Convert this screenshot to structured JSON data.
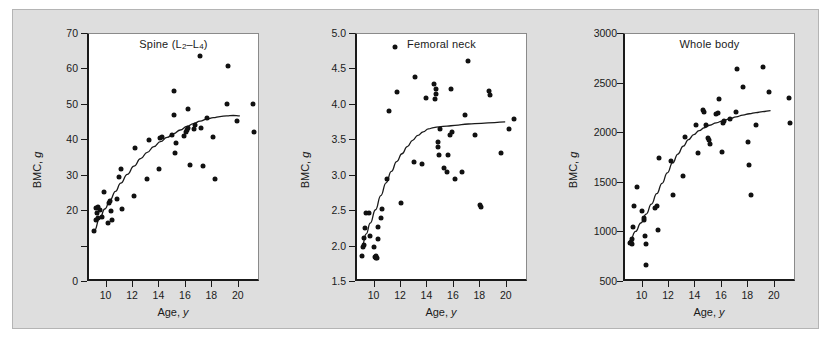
{
  "figure": {
    "background_color": "#dedede",
    "plot_background_color": "#ffffff",
    "point_color": "#111111",
    "axis_color": "#1a1a1a"
  },
  "chart_data": [
    {
      "type": "scatter",
      "title": "Spine (L2–L4)",
      "title_main": "Spine (L",
      "title_sub1": "2",
      "title_mid": "–L",
      "title_sub2": "4",
      "title_end": ")",
      "xlabel": "Age, y",
      "xlabel_text": "Age, ",
      "xlabel_italic": "y",
      "ylabel": "BMC, g",
      "ylabel_text": "BMC, ",
      "ylabel_italic": "g",
      "xlim": [
        8.6,
        21.6
      ],
      "ylim": [
        0,
        70
      ],
      "xticks": [
        10,
        12,
        14,
        16,
        18,
        20
      ],
      "xticklabels": [
        "10",
        "12",
        "14",
        "16",
        "18",
        "20"
      ],
      "yticks": [
        0,
        10,
        20,
        30,
        40,
        50,
        60,
        70
      ],
      "yticklabels": [
        "0",
        "",
        "20",
        "30",
        "40",
        "50",
        "60",
        "70"
      ],
      "grid": false,
      "legend": "none",
      "points": [
        [
          9.0,
          14.3
        ],
        [
          9.1,
          17.6
        ],
        [
          9.15,
          20.9
        ],
        [
          9.2,
          19.6
        ],
        [
          9.25,
          18.1
        ],
        [
          9.3,
          21.2
        ],
        [
          9.45,
          20.3
        ],
        [
          9.55,
          18.3
        ],
        [
          9.7,
          25.4
        ],
        [
          10.0,
          16.7
        ],
        [
          10.1,
          22.4
        ],
        [
          10.2,
          23.0
        ],
        [
          10.25,
          20.0
        ],
        [
          10.35,
          17.5
        ],
        [
          10.7,
          23.4
        ],
        [
          10.9,
          29.5
        ],
        [
          11.0,
          31.8
        ],
        [
          11.1,
          20.7
        ],
        [
          12.0,
          24.2
        ],
        [
          12.1,
          37.8
        ],
        [
          13.0,
          29.0
        ],
        [
          13.1,
          40.2
        ],
        [
          13.9,
          31.8
        ],
        [
          14.0,
          40.6
        ],
        [
          14.1,
          40.9
        ],
        [
          14.9,
          41.4
        ],
        [
          15.0,
          47.0
        ],
        [
          15.05,
          53.9
        ],
        [
          15.1,
          36.5
        ],
        [
          15.2,
          39.1
        ],
        [
          15.8,
          41.2
        ],
        [
          15.9,
          42.4
        ],
        [
          16.0,
          42.9
        ],
        [
          16.05,
          48.9
        ],
        [
          16.1,
          43.4
        ],
        [
          16.2,
          32.9
        ],
        [
          16.5,
          43.1
        ],
        [
          16.6,
          44.2
        ],
        [
          17.0,
          63.9
        ],
        [
          17.1,
          43.5
        ],
        [
          17.2,
          32.8
        ],
        [
          17.5,
          46.4
        ],
        [
          18.0,
          41.0
        ],
        [
          18.1,
          29.0
        ],
        [
          19.0,
          50.2
        ],
        [
          19.1,
          60.9
        ],
        [
          19.8,
          45.5
        ],
        [
          21.0,
          50.3
        ],
        [
          21.1,
          42.2
        ]
      ],
      "fit_curve": [
        [
          9.0,
          14.5
        ],
        [
          9.4,
          17.8
        ],
        [
          9.8,
          20.6
        ],
        [
          10.2,
          23.2
        ],
        [
          10.6,
          25.6
        ],
        [
          11.0,
          27.9
        ],
        [
          11.5,
          30.4
        ],
        [
          12.0,
          32.7
        ],
        [
          12.5,
          34.8
        ],
        [
          13.0,
          36.6
        ],
        [
          13.5,
          38.2
        ],
        [
          14.0,
          39.6
        ],
        [
          14.5,
          40.8
        ],
        [
          15.0,
          41.9
        ],
        [
          15.5,
          42.9
        ],
        [
          16.0,
          43.9
        ],
        [
          16.5,
          44.7
        ],
        [
          17.0,
          45.4
        ],
        [
          17.5,
          46.0
        ],
        [
          18.0,
          46.4
        ],
        [
          18.5,
          46.7
        ],
        [
          19.0,
          46.9
        ],
        [
          19.5,
          47.0
        ],
        [
          20.0,
          46.9
        ]
      ]
    },
    {
      "type": "scatter",
      "title": "Femoral neck",
      "xlabel": "Age, y",
      "xlabel_text": "Age, ",
      "xlabel_italic": "y",
      "ylabel": "BMC, g",
      "ylabel_text": "BMC, ",
      "ylabel_italic": "g",
      "xlim": [
        8.6,
        21.6
      ],
      "ylim": [
        1.5,
        5.0
      ],
      "xticks": [
        10,
        12,
        14,
        16,
        18,
        20
      ],
      "xticklabels": [
        "10",
        "12",
        "14",
        "16",
        "18",
        "20"
      ],
      "yticks": [
        1.5,
        2.0,
        2.5,
        3.0,
        3.5,
        4.0,
        4.5,
        5.0
      ],
      "yticklabels": [
        "1.5",
        "2.0",
        "2.5",
        "3.0",
        "3.5",
        "4.0",
        "4.5",
        "5.0"
      ],
      "grid": false,
      "legend": "none",
      "points": [
        [
          9.0,
          1.86
        ],
        [
          9.05,
          2.0
        ],
        [
          9.1,
          2.02
        ],
        [
          9.15,
          2.12
        ],
        [
          9.2,
          2.26
        ],
        [
          9.25,
          2.48
        ],
        [
          9.5,
          2.48
        ],
        [
          9.6,
          2.15
        ],
        [
          9.9,
          2.0
        ],
        [
          9.95,
          1.85
        ],
        [
          10.0,
          1.84
        ],
        [
          10.05,
          1.86
        ],
        [
          10.1,
          1.84
        ],
        [
          10.15,
          2.1
        ],
        [
          10.2,
          2.27
        ],
        [
          10.4,
          2.41
        ],
        [
          10.5,
          2.53
        ],
        [
          10.9,
          2.96
        ],
        [
          11.0,
          3.91
        ],
        [
          11.5,
          4.82
        ],
        [
          11.6,
          4.18
        ],
        [
          11.9,
          2.61
        ],
        [
          12.9,
          3.19
        ],
        [
          13.0,
          4.4
        ],
        [
          13.5,
          3.17
        ],
        [
          13.8,
          4.1
        ],
        [
          14.4,
          4.3
        ],
        [
          14.5,
          4.08
        ],
        [
          14.55,
          4.15
        ],
        [
          14.6,
          4.22
        ],
        [
          14.7,
          3.48
        ],
        [
          14.75,
          3.41
        ],
        [
          14.8,
          3.29
        ],
        [
          14.9,
          3.66
        ],
        [
          15.2,
          3.11
        ],
        [
          15.4,
          3.05
        ],
        [
          15.5,
          3.29
        ],
        [
          15.6,
          3.57
        ],
        [
          15.7,
          4.22
        ],
        [
          15.75,
          3.62
        ],
        [
          16.0,
          2.96
        ],
        [
          16.5,
          3.05
        ],
        [
          16.8,
          3.86
        ],
        [
          17.0,
          4.62
        ],
        [
          17.5,
          3.58
        ],
        [
          17.9,
          2.58
        ],
        [
          17.95,
          2.56
        ],
        [
          18.6,
          4.2
        ],
        [
          18.65,
          4.14
        ],
        [
          19.5,
          3.32
        ],
        [
          20.1,
          3.66
        ],
        [
          20.5,
          3.8
        ]
      ],
      "fit_curve": [
        [
          9.0,
          2.02
        ],
        [
          9.3,
          2.18
        ],
        [
          9.6,
          2.33
        ],
        [
          10.0,
          2.52
        ],
        [
          10.4,
          2.72
        ],
        [
          10.8,
          2.9
        ],
        [
          11.2,
          3.06
        ],
        [
          11.6,
          3.2
        ],
        [
          12.0,
          3.31
        ],
        [
          12.4,
          3.41
        ],
        [
          12.8,
          3.5
        ],
        [
          13.2,
          3.57
        ],
        [
          13.6,
          3.62
        ],
        [
          14.0,
          3.66
        ],
        [
          14.4,
          3.68
        ],
        [
          14.8,
          3.69
        ],
        [
          15.4,
          3.7
        ],
        [
          16.0,
          3.71
        ],
        [
          17.0,
          3.73
        ],
        [
          18.0,
          3.74
        ],
        [
          19.0,
          3.75
        ],
        [
          19.8,
          3.76
        ]
      ]
    },
    {
      "type": "scatter",
      "title": "Whole body",
      "xlabel": "Age, y",
      "xlabel_text": "Age, ",
      "xlabel_italic": "y",
      "ylabel": "BMC, g",
      "ylabel_text": "BMC, ",
      "ylabel_italic": "g",
      "xlim": [
        8.6,
        21.6
      ],
      "ylim": [
        500,
        3000
      ],
      "xticks": [
        10,
        12,
        14,
        16,
        18,
        20
      ],
      "xticklabels": [
        "10",
        "12",
        "14",
        "16",
        "18",
        "20"
      ],
      "yticks": [
        500,
        1000,
        1500,
        2000,
        2500,
        3000
      ],
      "yticklabels": [
        "500",
        "1000",
        "1500",
        "2000",
        "2500",
        "3000"
      ],
      "grid": false,
      "legend": "none",
      "points": [
        [
          9.0,
          890
        ],
        [
          9.05,
          905
        ],
        [
          9.1,
          880
        ],
        [
          9.15,
          935
        ],
        [
          9.2,
          1050
        ],
        [
          9.25,
          1265
        ],
        [
          9.5,
          1460
        ],
        [
          9.9,
          1220
        ],
        [
          10.0,
          1120
        ],
        [
          10.05,
          1150
        ],
        [
          10.1,
          960
        ],
        [
          10.15,
          880
        ],
        [
          10.2,
          675
        ],
        [
          10.9,
          1250
        ],
        [
          11.0,
          1265
        ],
        [
          11.1,
          1020
        ],
        [
          11.2,
          1755
        ],
        [
          12.1,
          1720
        ],
        [
          12.2,
          1375
        ],
        [
          13.0,
          1565
        ],
        [
          13.1,
          1960
        ],
        [
          14.0,
          2080
        ],
        [
          14.1,
          1800
        ],
        [
          14.5,
          2235
        ],
        [
          14.6,
          2215
        ],
        [
          14.7,
          2080
        ],
        [
          14.9,
          1955
        ],
        [
          14.95,
          1930
        ],
        [
          15.0,
          1890
        ],
        [
          15.5,
          2190
        ],
        [
          15.6,
          2200
        ],
        [
          15.7,
          2340
        ],
        [
          15.9,
          1810
        ],
        [
          16.0,
          2100
        ],
        [
          16.05,
          2120
        ],
        [
          16.5,
          2145
        ],
        [
          17.0,
          2210
        ],
        [
          17.1,
          2650
        ],
        [
          17.5,
          2470
        ],
        [
          17.9,
          1915
        ],
        [
          18.0,
          1675
        ],
        [
          18.1,
          1375
        ],
        [
          18.5,
          2080
        ],
        [
          19.0,
          2670
        ],
        [
          19.5,
          2415
        ],
        [
          21.0,
          2355
        ],
        [
          21.1,
          2105
        ]
      ],
      "fit_curve": [
        [
          9.0,
          925
        ],
        [
          9.4,
          1010
        ],
        [
          9.8,
          1095
        ],
        [
          10.2,
          1185
        ],
        [
          10.6,
          1285
        ],
        [
          11.0,
          1390
        ],
        [
          11.4,
          1495
        ],
        [
          11.8,
          1600
        ],
        [
          12.2,
          1700
        ],
        [
          12.6,
          1790
        ],
        [
          13.0,
          1870
        ],
        [
          13.4,
          1935
        ],
        [
          13.8,
          1985
        ],
        [
          14.2,
          2025
        ],
        [
          14.6,
          2055
        ],
        [
          15.0,
          2080
        ],
        [
          15.5,
          2105
        ],
        [
          16.0,
          2125
        ],
        [
          16.5,
          2145
        ],
        [
          17.0,
          2165
        ],
        [
          17.5,
          2182
        ],
        [
          18.0,
          2196
        ],
        [
          18.5,
          2208
        ],
        [
          19.0,
          2218
        ],
        [
          19.6,
          2228
        ]
      ]
    }
  ]
}
